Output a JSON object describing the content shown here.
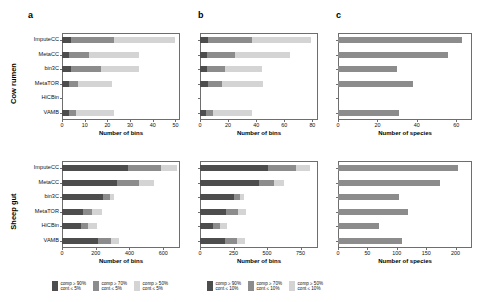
{
  "figure": {
    "panel_labels": [
      "a",
      "b",
      "c"
    ],
    "row_groups": [
      "Cow rumen",
      "Sheep gut"
    ],
    "methods": [
      "ImputeCC",
      "MetaCC",
      "bin3C",
      "MetaTOR",
      "HiCBin",
      "VAMB"
    ],
    "colors": {
      "dark": "#4d4d4d",
      "medium": "#8c8c8c",
      "light": "#d4d4d4",
      "axis": "#6e6e6e",
      "background": "#ffffff"
    }
  },
  "legend": {
    "groups": [
      {
        "name": "cont-5",
        "items": [
          {
            "color": "#4d4d4d",
            "line1": "comp ≥ 90%",
            "line2": "cont ≤ 5%"
          },
          {
            "color": "#8c8c8c",
            "line1": "comp ≥ 70%",
            "line2": "cont ≤ 5%"
          },
          {
            "color": "#d4d4d4",
            "line1": "comp ≥ 50%",
            "line2": "cont ≤ 5%"
          }
        ]
      },
      {
        "name": "cont-10",
        "items": [
          {
            "color": "#4d4d4d",
            "line1": "comp ≥ 90%",
            "line2": "cont ≤ 10%"
          },
          {
            "color": "#8c8c8c",
            "line1": "comp ≥ 70%",
            "line2": "cont ≤ 10%"
          },
          {
            "color": "#d4d4d4",
            "line1": "comp ≥ 50%",
            "line2": "cont ≤ 10%"
          }
        ]
      }
    ]
  },
  "chart_data": [
    {
      "id": "cow-a",
      "type": "bar",
      "orientation": "horizontal",
      "stacked": true,
      "title": "",
      "panel": "a",
      "group": "Cow rumen",
      "xlabel": "Number of bins",
      "ylabel": "",
      "xlim": [
        0,
        52
      ],
      "xticks": [
        0,
        10,
        20,
        30,
        40,
        50
      ],
      "categories": [
        "ImputeCC",
        "MetaCC",
        "bin3C",
        "MetaTOR",
        "HiCBin",
        "VAMB"
      ],
      "series": [
        {
          "name": "comp ≥ 90% cont ≤ 5%",
          "color": "#4d4d4d",
          "values": [
            4,
            3,
            4,
            3,
            0,
            3
          ]
        },
        {
          "name": "comp ≥ 70% cont ≤ 5%",
          "color": "#8c8c8c",
          "values": [
            19,
            9,
            13,
            4,
            0,
            3
          ]
        },
        {
          "name": "comp ≥ 50% cont ≤ 5%",
          "color": "#d4d4d4",
          "values": [
            27,
            22,
            17,
            15,
            0,
            17
          ]
        }
      ],
      "totals": [
        50,
        34,
        34,
        22,
        0,
        23
      ],
      "grid": false
    },
    {
      "id": "cow-b",
      "type": "bar",
      "orientation": "horizontal",
      "stacked": true,
      "panel": "b",
      "group": "Cow rumen",
      "xlabel": "Number of bins",
      "ylabel": "",
      "xlim": [
        0,
        84
      ],
      "xticks": [
        0,
        20,
        40,
        60,
        80
      ],
      "categories": [
        "ImputeCC",
        "MetaCC",
        "bin3C",
        "MetaTOR",
        "HiCBin",
        "VAMB"
      ],
      "series": [
        {
          "name": "comp ≥ 90% cont ≤ 10%",
          "color": "#4d4d4d",
          "values": [
            6,
            5,
            5,
            6,
            0,
            4
          ]
        },
        {
          "name": "comp ≥ 70% cont ≤ 10%",
          "color": "#8c8c8c",
          "values": [
            31,
            20,
            13,
            10,
            0,
            5
          ]
        },
        {
          "name": "comp ≥ 50% cont ≤ 10%",
          "color": "#d4d4d4",
          "values": [
            42,
            39,
            26,
            29,
            0,
            28
          ]
        }
      ],
      "totals": [
        79,
        64,
        44,
        45,
        0,
        37
      ],
      "grid": false
    },
    {
      "id": "cow-c",
      "type": "bar",
      "orientation": "horizontal",
      "stacked": false,
      "panel": "c",
      "group": "Cow rumen",
      "xlabel": "Number of species",
      "ylabel": "",
      "xlim": [
        0,
        68
      ],
      "xticks": [
        0,
        20,
        40,
        60
      ],
      "categories": [
        "ImputeCC",
        "MetaCC",
        "bin3C",
        "MetaTOR",
        "HiCBin",
        "VAMB"
      ],
      "series": [
        {
          "name": "species",
          "color": "#8c8c8c",
          "values": [
            63,
            56,
            30,
            38,
            0,
            31
          ]
        }
      ],
      "grid": false
    },
    {
      "id": "sheep-a",
      "type": "bar",
      "orientation": "horizontal",
      "stacked": true,
      "panel": "a",
      "group": "Sheep gut",
      "xlabel": "Number of bins",
      "ylabel": "",
      "xlim": [
        0,
        700
      ],
      "xticks": [
        0,
        200,
        400,
        600
      ],
      "categories": [
        "ImputeCC",
        "MetaCC",
        "bin3C",
        "MetaTOR",
        "HiCBin",
        "VAMB"
      ],
      "series": [
        {
          "name": "comp ≥ 90% cont ≤ 5%",
          "color": "#4d4d4d",
          "values": [
            390,
            325,
            245,
            125,
            110,
            215
          ]
        },
        {
          "name": "comp ≥ 70% cont ≤ 5%",
          "color": "#8c8c8c",
          "values": [
            200,
            130,
            40,
            55,
            45,
            75
          ]
        },
        {
          "name": "comp ≥ 50% cont ≤ 5%",
          "color": "#d4d4d4",
          "values": [
            90,
            90,
            25,
            60,
            55,
            50
          ]
        }
      ],
      "totals": [
        680,
        545,
        310,
        240,
        210,
        340
      ],
      "grid": false
    },
    {
      "id": "sheep-b",
      "type": "bar",
      "orientation": "horizontal",
      "stacked": true,
      "panel": "b",
      "group": "Sheep gut",
      "xlabel": "Number of bins",
      "ylabel": "",
      "xlim": [
        0,
        880
      ],
      "xticks": [
        0,
        250,
        500,
        750
      ],
      "categories": [
        "ImputeCC",
        "MetaCC",
        "bin3C",
        "MetaTOR",
        "HiCBin",
        "VAMB"
      ],
      "series": [
        {
          "name": "comp ≥ 90% cont ≤ 10%",
          "color": "#4d4d4d",
          "values": [
            505,
            440,
            255,
            195,
            95,
            185
          ]
        },
        {
          "name": "comp ≥ 70% cont ≤ 10%",
          "color": "#8c8c8c",
          "values": [
            210,
            115,
            45,
            85,
            55,
            90
          ]
        },
        {
          "name": "comp ≥ 50% cont ≤ 10%",
          "color": "#d4d4d4",
          "values": [
            105,
            70,
            30,
            65,
            55,
            60
          ]
        }
      ],
      "totals": [
        820,
        625,
        330,
        345,
        205,
        335
      ],
      "grid": false
    },
    {
      "id": "sheep-c",
      "type": "bar",
      "orientation": "horizontal",
      "stacked": false,
      "panel": "c",
      "group": "Sheep gut",
      "xlabel": "Number of species",
      "ylabel": "",
      "xlim": [
        0,
        228
      ],
      "xticks": [
        0,
        50,
        100,
        150,
        200
      ],
      "categories": [
        "ImputeCC",
        "MetaCC",
        "bin3C",
        "MetaTOR",
        "HiCBin",
        "VAMB"
      ],
      "series": [
        {
          "name": "species",
          "color": "#8c8c8c",
          "values": [
            205,
            174,
            103,
            119,
            69,
            109
          ]
        }
      ],
      "grid": false
    }
  ]
}
